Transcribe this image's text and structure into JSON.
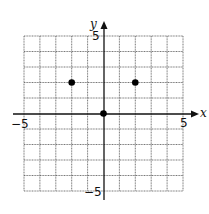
{
  "chart_data": {
    "type": "scatter",
    "title": "",
    "xlabel": "x",
    "ylabel": "y",
    "xlim": [
      -5,
      5
    ],
    "ylim": [
      -5,
      5
    ],
    "grid": true,
    "tick_labels": {
      "x_min": "−5",
      "x_max": "5",
      "y_min": "−5",
      "y_max": "5"
    },
    "points": [
      {
        "x": -2,
        "y": 2
      },
      {
        "x": 0,
        "y": 0
      },
      {
        "x": 2,
        "y": 2
      }
    ]
  }
}
